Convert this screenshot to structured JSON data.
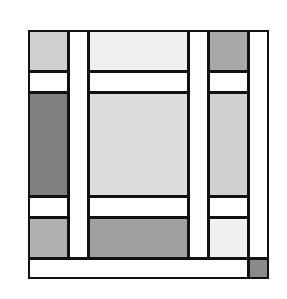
{
  "diagram": {
    "outer": {
      "x": 28,
      "y": 30,
      "w": 241,
      "h": 249
    },
    "cells": [
      {
        "name": "cell-top-left",
        "x": 28,
        "y": 30,
        "w": 41,
        "h": 42,
        "color": "#cfcfcf"
      },
      {
        "name": "cell-top-center",
        "x": 88,
        "y": 30,
        "w": 101,
        "h": 42,
        "color": "#f0f0f0"
      },
      {
        "name": "cell-top-right",
        "x": 208,
        "y": 30,
        "w": 41,
        "h": 42,
        "color": "#a8a8a8"
      },
      {
        "name": "strip-h1-left",
        "x": 28,
        "y": 71,
        "w": 41,
        "h": 22,
        "color": "#ffffff"
      },
      {
        "name": "strip-h1-center",
        "x": 88,
        "y": 71,
        "w": 101,
        "h": 22,
        "color": "#ffffff"
      },
      {
        "name": "strip-h1-right",
        "x": 208,
        "y": 71,
        "w": 41,
        "h": 22,
        "color": "#ffffff"
      },
      {
        "name": "cell-middle-left",
        "x": 28,
        "y": 92,
        "w": 41,
        "h": 105,
        "color": "#808080"
      },
      {
        "name": "cell-middle-center",
        "x": 88,
        "y": 92,
        "w": 101,
        "h": 105,
        "color": "#dcdcdc"
      },
      {
        "name": "cell-middle-right",
        "x": 208,
        "y": 92,
        "w": 41,
        "h": 105,
        "color": "#d0d0d0"
      },
      {
        "name": "strip-h2-left",
        "x": 28,
        "y": 196,
        "w": 41,
        "h": 22,
        "color": "#ffffff"
      },
      {
        "name": "strip-h2-center",
        "x": 88,
        "y": 196,
        "w": 101,
        "h": 22,
        "color": "#ffffff"
      },
      {
        "name": "strip-h2-right",
        "x": 208,
        "y": 196,
        "w": 41,
        "h": 22,
        "color": "#ffffff"
      },
      {
        "name": "cell-bottom-left",
        "x": 28,
        "y": 217,
        "w": 41,
        "h": 42,
        "color": "#b0b0b0"
      },
      {
        "name": "cell-bottom-center",
        "x": 88,
        "y": 217,
        "w": 101,
        "h": 42,
        "color": "#a0a0a0"
      },
      {
        "name": "cell-bottom-right",
        "x": 208,
        "y": 217,
        "w": 41,
        "h": 42,
        "color": "#f0f0f0"
      },
      {
        "name": "strip-v1",
        "x": 68,
        "y": 30,
        "w": 21,
        "h": 229,
        "color": "#ffffff"
      },
      {
        "name": "strip-v2",
        "x": 188,
        "y": 30,
        "w": 21,
        "h": 229,
        "color": "#ffffff"
      },
      {
        "name": "strip-v-right",
        "x": 248,
        "y": 30,
        "w": 21,
        "h": 229,
        "color": "#ffffff"
      },
      {
        "name": "strip-bottom",
        "x": 28,
        "y": 258,
        "w": 221,
        "h": 21,
        "color": "#ffffff"
      },
      {
        "name": "cell-corner-square",
        "x": 248,
        "y": 258,
        "w": 21,
        "h": 21,
        "color": "#8a8a8a"
      }
    ]
  }
}
